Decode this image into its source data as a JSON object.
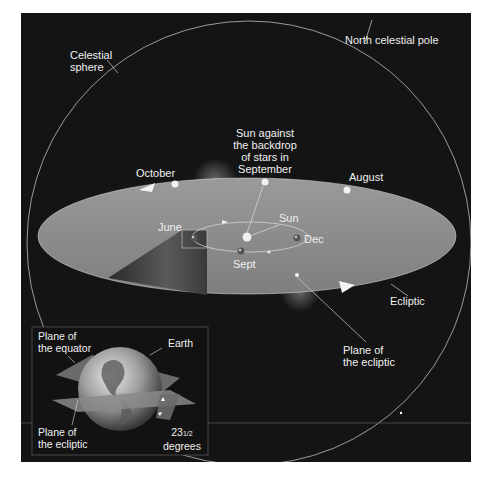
{
  "diagram": {
    "colors": {
      "background": "#141414",
      "ecliptic_plane": "#8c8c8c",
      "sphere_line": "#bdbdbd",
      "label": "#f0f0f0"
    },
    "labels": {
      "celestial_sphere": [
        "Celestial",
        "sphere"
      ],
      "north_celestial_pole": "North celestial pole",
      "sun_backdrop": [
        "Sun against",
        "the backdrop",
        "of stars in",
        "September"
      ],
      "october": "October",
      "august": "August",
      "june": "June",
      "sun": "Sun",
      "dec": "Dec",
      "sept": "Sept",
      "ecliptic": "Ecliptic",
      "plane_of_ecliptic": [
        "Plane of",
        "the ecliptic"
      ]
    },
    "inset": {
      "plane_of_equator": [
        "Plane of",
        "the equator"
      ],
      "earth": "Earth",
      "plane_of_ecliptic": [
        "Plane of",
        "the ecliptic"
      ],
      "tilt_value": "23",
      "tilt_fraction": "1/2",
      "tilt_unit": "degrees"
    }
  }
}
